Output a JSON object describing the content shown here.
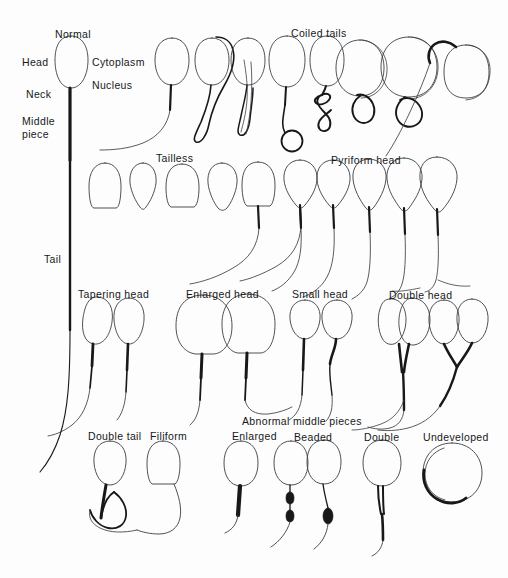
{
  "figure": {
    "background_color": "#fdfdfd",
    "ink_color": "#16181a",
    "outline_color": "#3a3d42"
  },
  "anatomy_labels": [
    {
      "id": "normal",
      "text": "Normal",
      "x": 55,
      "y": 28
    },
    {
      "id": "head",
      "text": "Head",
      "x": 22,
      "y": 56
    },
    {
      "id": "cytoplasm",
      "text": "Cytoplasm",
      "x": 92,
      "y": 56
    },
    {
      "id": "nucleus",
      "text": "Nucleus",
      "x": 92,
      "y": 79
    },
    {
      "id": "neck",
      "text": "Neck",
      "x": 26,
      "y": 88
    },
    {
      "id": "middle_piece",
      "text": "Middle piece",
      "x": 22,
      "y": 115
    },
    {
      "id": "tail",
      "text": "Tail",
      "x": 44,
      "y": 253
    }
  ],
  "group_labels": [
    {
      "id": "coiled_tails",
      "text": "Coiled tails",
      "x": 291,
      "y": 27
    },
    {
      "id": "tailless",
      "text": "Tailless",
      "x": 156,
      "y": 152
    },
    {
      "id": "pyriform_head",
      "text": "Pyriform head",
      "x": 331,
      "y": 154
    },
    {
      "id": "tapering_head",
      "text": "Tapering head",
      "x": 78,
      "y": 288
    },
    {
      "id": "enlarged_head",
      "text": "Enlarged head",
      "x": 186,
      "y": 288
    },
    {
      "id": "small_head",
      "text": "Small head",
      "x": 292,
      "y": 288
    },
    {
      "id": "double_head",
      "text": "Double head",
      "x": 389,
      "y": 289
    },
    {
      "id": "abnormal_middle_pieces",
      "text": "Abnormal middle pieces",
      "x": 242,
      "y": 415
    },
    {
      "id": "double_tail",
      "text": "Double tail",
      "x": 88,
      "y": 430
    },
    {
      "id": "filiform",
      "text": "Filiform",
      "x": 150,
      "y": 430
    },
    {
      "id": "enlarged",
      "text": "Enlarged",
      "x": 232,
      "y": 430
    },
    {
      "id": "beaded",
      "text": "Beaded",
      "x": 294,
      "y": 431
    },
    {
      "id": "double",
      "text": "Double",
      "x": 364,
      "y": 431
    },
    {
      "id": "undeveloped",
      "text": "Undeveloped",
      "x": 423,
      "y": 431
    }
  ],
  "specimens": {
    "row1_normal_and_coiled": [
      {
        "id": "normal-sperm",
        "label": "Normal",
        "head_cx": 71,
        "head_cy": 66
      },
      {
        "id": "coiled-curved-tail",
        "label": "Coiled tails",
        "head_cx": 172,
        "head_cy": 62
      },
      {
        "id": "coiled-loop-1",
        "label": "Coiled tails",
        "head_cx": 212,
        "head_cy": 62
      },
      {
        "id": "coiled-loop-2",
        "label": "Coiled tails",
        "head_cx": 248,
        "head_cy": 62
      },
      {
        "id": "coiled-ring-3",
        "label": "Coiled tails",
        "head_cx": 287,
        "head_cy": 62
      },
      {
        "id": "coiled-knot-4",
        "label": "Coiled tails",
        "head_cx": 327,
        "head_cy": 62
      },
      {
        "id": "coiled-spiral-5",
        "label": "Coiled tails",
        "head_cx": 360,
        "head_cy": 62
      },
      {
        "id": "coiled-loop-6",
        "label": "Coiled tails",
        "head_cx": 409,
        "head_cy": 62
      },
      {
        "id": "coiled-hook-7",
        "label": "Coiled tails",
        "head_cx": 466,
        "head_cy": 66
      }
    ],
    "row2_tailless_and_pyriform": [
      {
        "id": "tailless-1",
        "label": "Tailless",
        "head_cx": 105,
        "head_cy": 186
      },
      {
        "id": "tailless-2",
        "label": "Tailless",
        "head_cx": 143,
        "head_cy": 186
      },
      {
        "id": "tailless-3",
        "label": "Tailless",
        "head_cx": 182,
        "head_cy": 186
      },
      {
        "id": "tailless-4",
        "label": "Tailless",
        "head_cx": 222,
        "head_cy": 186
      },
      {
        "id": "tailless-5",
        "label": "Tailless",
        "head_cx": 258,
        "head_cy": 186
      },
      {
        "id": "pyriform-1",
        "label": "Pyriform head",
        "head_cx": 300,
        "head_cy": 180
      },
      {
        "id": "pyriform-2",
        "label": "Pyriform head",
        "head_cx": 333,
        "head_cy": 181
      },
      {
        "id": "pyriform-3",
        "label": "Pyriform head",
        "head_cx": 369,
        "head_cy": 180
      },
      {
        "id": "pyriform-4",
        "label": "Pyriform head",
        "head_cx": 404,
        "head_cy": 179
      },
      {
        "id": "pyriform-5",
        "label": "Pyriform head",
        "head_cx": 437,
        "head_cy": 178
      }
    ],
    "row3_head_shapes": [
      {
        "id": "tapering-1",
        "label": "Tapering head",
        "head_cx": 97,
        "head_cy": 320
      },
      {
        "id": "tapering-2",
        "label": "Tapering head",
        "head_cx": 128,
        "head_cy": 320
      },
      {
        "id": "enlarged-head-1",
        "label": "Enlarged head",
        "head_cx": 203,
        "head_cy": 320
      },
      {
        "id": "enlarged-head-2",
        "label": "Enlarged head",
        "head_cx": 247,
        "head_cy": 320
      },
      {
        "id": "small-head-1",
        "label": "Small head",
        "head_cx": 305,
        "head_cy": 317
      },
      {
        "id": "small-head-2",
        "label": "Small head",
        "head_cx": 336,
        "head_cy": 317
      },
      {
        "id": "double-head-1",
        "label": "Double head",
        "head_cx": 398,
        "head_cy": 317
      },
      {
        "id": "double-head-2",
        "label": "Double head",
        "head_cx": 452,
        "head_cy": 317
      }
    ],
    "row4_middle_pieces": [
      {
        "id": "double-tail",
        "label": "Double tail",
        "head_cx": 110,
        "head_cy": 463
      },
      {
        "id": "filiform",
        "label": "Filiform",
        "head_cx": 163,
        "head_cy": 463
      },
      {
        "id": "enlarged-mp",
        "label": "Enlarged",
        "head_cx": 240,
        "head_cy": 463
      },
      {
        "id": "beaded-mp-1",
        "label": "Beaded",
        "head_cx": 291,
        "head_cy": 463
      },
      {
        "id": "beaded-mp-2",
        "label": "Beaded",
        "head_cx": 324,
        "head_cy": 463
      },
      {
        "id": "double-mp",
        "label": "Double",
        "head_cx": 382,
        "head_cy": 463
      },
      {
        "id": "undeveloped",
        "label": "Undeveloped",
        "head_cx": 450,
        "head_cy": 470
      }
    ]
  }
}
